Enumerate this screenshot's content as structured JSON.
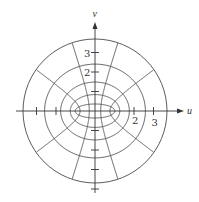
{
  "diagram": {
    "axes": {
      "horizontal_label": "u",
      "vertical_label": "v"
    },
    "tick_labels": {
      "u": [
        {
          "value": 2,
          "text": "2"
        },
        {
          "value": 3,
          "text": "3"
        }
      ],
      "v": [
        {
          "value": 2,
          "text": "2"
        },
        {
          "value": 3,
          "text": "3"
        }
      ]
    },
    "tick_values": {
      "u": [
        -3,
        -2,
        2,
        3
      ],
      "v": [
        -4,
        -3,
        -2,
        -1,
        1,
        2,
        3
      ]
    },
    "geometry": {
      "center": [
        95,
        111
      ],
      "unit_px": 19.5,
      "focal_distance_px": 18.5,
      "outer_circle_radius_px": 72,
      "ellipse_mu_values": [
        0.37,
        0.8,
        1.23,
        1.66
      ],
      "hyperbola_nu_degrees": [
        36,
        72,
        108,
        144,
        216,
        252,
        288,
        324
      ]
    },
    "colors": {
      "line": "#4a4a4a",
      "axis": "#333333",
      "background": "#ffffff"
    }
  }
}
